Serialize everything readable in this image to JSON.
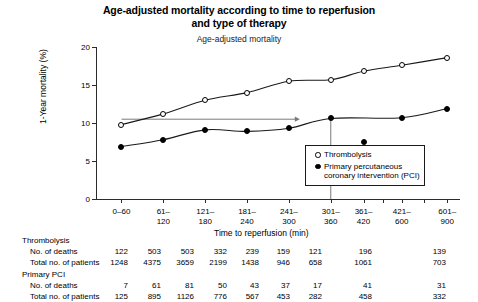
{
  "title": {
    "line1": "Age-adjusted mortality according to time to reperfusion",
    "line2": "and type of therapy"
  },
  "subtitle": "Age-adjusted mortality",
  "axes": {
    "ylabel": "1-Year mortality (%)",
    "xlabel": "Time to reperfusion (min)",
    "yticks": [
      "0",
      "5",
      "10",
      "15",
      "20"
    ],
    "ylim_min": 0,
    "ylim_max": 20
  },
  "legend": {
    "items": [
      {
        "marker": "open-circle",
        "label": "Thrombolysis"
      },
      {
        "marker": "filled-circle",
        "label": "Primary percutaneous\ncoronary intervention (PCI)",
        "label_line1": "Primary percutaneous",
        "label_line2": "coronary intervention (PCI)"
      }
    ]
  },
  "chart_data": {
    "type": "line",
    "title": "Age-adjusted mortality according to time to reperfusion and type of therapy",
    "subtitle": "Age-adjusted mortality",
    "xlabel": "Time to reperfusion (min)",
    "ylabel": "1-Year mortality (%)",
    "ylim": [
      0,
      20
    ],
    "yticks": [
      0,
      5,
      10,
      15,
      20
    ],
    "grid": false,
    "legend_position": "inside-lower-right",
    "categories": [
      "0–60",
      "61–120",
      "121–180",
      "181–240",
      "241–300",
      "301–360",
      "361–420",
      "421–600",
      "601–900"
    ],
    "category_labels_top": [
      "0–60",
      "61–",
      "121–",
      "181–",
      "241–",
      "301–",
      "361–",
      "421–",
      "601–"
    ],
    "category_labels_bottom": [
      "",
      "120",
      "180",
      "240",
      "300",
      "360",
      "420",
      "600",
      "900"
    ],
    "x_positions_pct": [
      7.0,
      18.5,
      30.0,
      41.5,
      53.0,
      64.5,
      73.5,
      84.0,
      96.5
    ],
    "series": [
      {
        "name": "Thrombolysis",
        "marker": "open-circle",
        "values": [
          9.8,
          11.2,
          13.0,
          14.0,
          15.5,
          15.7,
          16.8,
          17.6,
          18.6
        ]
      },
      {
        "name": "Primary percutaneous coronary intervention (PCI)",
        "marker": "filled-circle",
        "values": [
          6.9,
          7.8,
          9.1,
          8.9,
          9.3,
          10.6,
          7.5,
          10.7,
          11.9
        ]
      }
    ],
    "annotations": [
      {
        "type": "horizontal-arrow",
        "y": 10.5,
        "x_start_pct": 7.0,
        "x_end_pct": 56.0,
        "color": "#7a7a7a"
      },
      {
        "type": "vertical-line",
        "x_pct": 64.5,
        "y_start": 0,
        "y_end": 10.6,
        "color": "#7a7a7a"
      }
    ]
  },
  "tables": [
    {
      "heading": "Thrombolysis",
      "rows": [
        {
          "label": "No. of deaths",
          "values": [
            "122",
            "503",
            "503",
            "332",
            "239",
            "159",
            "121",
            "196",
            "139"
          ]
        },
        {
          "label": "Total no. of patients",
          "values": [
            "1248",
            "4375",
            "3659",
            "2199",
            "1438",
            "946",
            "658",
            "1061",
            "703"
          ]
        }
      ]
    },
    {
      "heading": "Primary PCI",
      "rows": [
        {
          "label": "No. of deaths",
          "values": [
            "7",
            "61",
            "81",
            "50",
            "43",
            "37",
            "17",
            "41",
            "31"
          ]
        },
        {
          "label": "Total no. of patients",
          "values": [
            "125",
            "895",
            "1126",
            "776",
            "567",
            "453",
            "282",
            "458",
            "332"
          ]
        }
      ]
    }
  ]
}
